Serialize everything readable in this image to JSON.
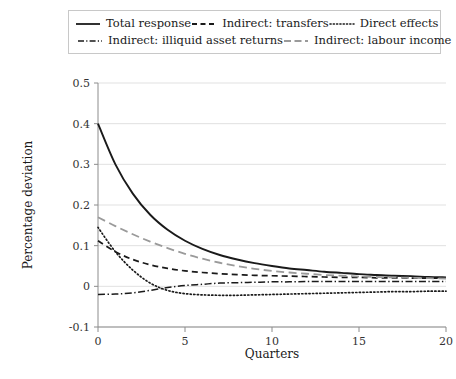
{
  "chart_data": {
    "type": "line",
    "title": "",
    "xlabel": "Quarters",
    "ylabel": "Percentage deviation",
    "xlim": [
      0,
      20
    ],
    "ylim": [
      -0.1,
      0.5
    ],
    "xticks": [
      "0",
      "5",
      "10",
      "15",
      "20"
    ],
    "xtick_values": [
      0,
      5,
      10,
      15,
      20
    ],
    "yticks": [
      "-0.1",
      "0",
      "0.1",
      "0.2",
      "0.3",
      "0.4",
      "0.5"
    ],
    "ytick_values": [
      -0.1,
      0,
      0.1,
      0.2,
      0.3,
      0.4,
      0.5
    ],
    "grid": true,
    "legend_position": "top",
    "x": [
      0,
      1,
      2,
      3,
      4,
      5,
      6,
      7,
      8,
      9,
      10,
      11,
      12,
      13,
      14,
      15,
      16,
      17,
      18,
      19,
      20
    ],
    "series": [
      {
        "name": "Total response",
        "style": "solid",
        "color": "#1a1a1a",
        "values": [
          0.4,
          0.3,
          0.228,
          0.176,
          0.139,
          0.112,
          0.092,
          0.077,
          0.066,
          0.057,
          0.05,
          0.044,
          0.04,
          0.036,
          0.033,
          0.03,
          0.028,
          0.026,
          0.025,
          0.023,
          0.022
        ]
      },
      {
        "name": "Indirect: transfers",
        "style": "dashed",
        "color": "#1a1a1a",
        "values": [
          0.112,
          0.085,
          0.066,
          0.053,
          0.044,
          0.038,
          0.034,
          0.031,
          0.029,
          0.027,
          0.026,
          0.025,
          0.024,
          0.023,
          0.022,
          0.022,
          0.021,
          0.021,
          0.02,
          0.02,
          0.02
        ]
      },
      {
        "name": "Direct effects",
        "style": "dotted",
        "color": "#1a1a1a",
        "values": [
          0.145,
          0.085,
          0.04,
          0.008,
          -0.01,
          -0.018,
          -0.021,
          -0.022,
          -0.022,
          -0.021,
          -0.02,
          -0.019,
          -0.018,
          -0.017,
          -0.016,
          -0.015,
          -0.014,
          -0.013,
          -0.013,
          -0.012,
          -0.012
        ]
      },
      {
        "name": "Indirect: illiquid asset returns",
        "style": "dashdot",
        "color": "#1a1a1a",
        "values": [
          -0.02,
          -0.019,
          -0.016,
          -0.01,
          -0.003,
          0.002,
          0.005,
          0.008,
          0.009,
          0.01,
          0.011,
          0.011,
          0.012,
          0.012,
          0.012,
          0.012,
          0.012,
          0.012,
          0.012,
          0.012,
          0.012
        ]
      },
      {
        "name": "Indirect: labour income",
        "style": "longdash",
        "color": "#9a9a9a",
        "values": [
          0.17,
          0.148,
          0.128,
          0.11,
          0.094,
          0.08,
          0.068,
          0.058,
          0.05,
          0.043,
          0.038,
          0.034,
          0.031,
          0.028,
          0.026,
          0.024,
          0.023,
          0.022,
          0.021,
          0.02,
          0.019
        ]
      }
    ]
  },
  "legend": {
    "rows": [
      [
        {
          "label": "Total response",
          "style": "solid",
          "color": "#1a1a1a"
        },
        {
          "label": "Indirect: transfers",
          "style": "dashed",
          "color": "#1a1a1a"
        },
        {
          "label": "Direct effects",
          "style": "dotted",
          "color": "#1a1a1a"
        }
      ],
      [
        {
          "label": "Indirect: illiquid asset returns",
          "style": "dashdot",
          "color": "#1a1a1a"
        },
        {
          "label": "Indirect: labour income",
          "style": "longdash",
          "color": "#9a9a9a"
        }
      ]
    ]
  }
}
